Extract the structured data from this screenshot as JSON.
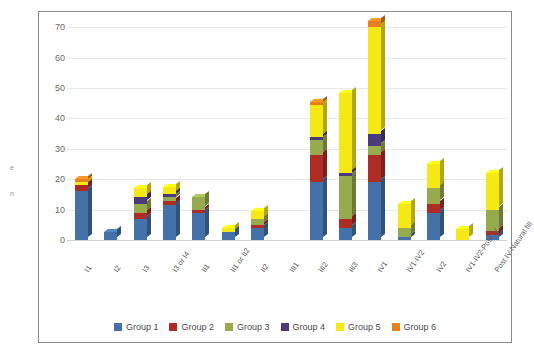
{
  "edge_text_fragments": [
    "e",
    "n"
  ],
  "chart_data": {
    "type": "bar",
    "subtype": "stacked-3d-column",
    "title": "",
    "subtitle": "",
    "xlabel": "",
    "ylabel": "",
    "ylim": [
      0,
      75
    ],
    "yticks": [
      0,
      10,
      20,
      30,
      40,
      50,
      60,
      70
    ],
    "ytick_labels": [
      "0",
      "10",
      "20",
      "30",
      "40",
      "50",
      "60",
      "70"
    ],
    "grid": true,
    "grid_axis": "y",
    "legend_position": "bottom",
    "categories": [
      "I1",
      "I2",
      "I3",
      "I3 or I4",
      "II1",
      "II1 or II2",
      "II2",
      "III1",
      "III2",
      "III3",
      "IV1",
      "IV1-IV2",
      "IV2",
      "IV1-IV2-Post IV",
      "Post IV-Natural fill"
    ],
    "series": [
      {
        "name": "Group 1",
        "color": "#4472A8",
        "values": [
          16,
          2.5,
          7,
          11.5,
          9,
          2.5,
          4,
          0,
          19,
          4,
          19,
          1,
          9,
          0,
          1.5
        ]
      },
      {
        "name": "Group 2",
        "color": "#AE2C24",
        "values": [
          2,
          0,
          2,
          1.5,
          1,
          0,
          1,
          0,
          9,
          3,
          9,
          0,
          3,
          0,
          1.5
        ]
      },
      {
        "name": "Group 3",
        "color": "#97AB4E",
        "values": [
          0,
          0,
          3,
          1,
          4,
          0,
          2,
          0,
          5,
          14,
          3,
          3,
          5,
          0,
          7
        ]
      },
      {
        "name": "Group 4",
        "color": "#4A3A7B",
        "values": [
          0,
          0,
          2,
          1,
          0,
          0,
          0,
          0,
          1,
          1,
          4,
          0,
          0,
          0,
          0
        ]
      },
      {
        "name": "Group 5",
        "color": "#F6E812",
        "values": [
          1,
          0,
          3,
          2.5,
          0,
          1.5,
          2.5,
          0,
          10.5,
          26.5,
          35,
          8,
          8,
          3.5,
          12
        ]
      },
      {
        "name": "Group 6",
        "color": "#E8801F",
        "values": [
          1,
          0,
          0,
          0,
          0,
          0,
          0,
          0,
          1,
          0,
          2,
          0,
          0,
          0,
          0
        ]
      }
    ],
    "totals": [
      20,
      2.5,
      17,
      17.5,
      14,
      4,
      9.5,
      0,
      45.5,
      48.5,
      72,
      12,
      25,
      3.5,
      22
    ]
  }
}
